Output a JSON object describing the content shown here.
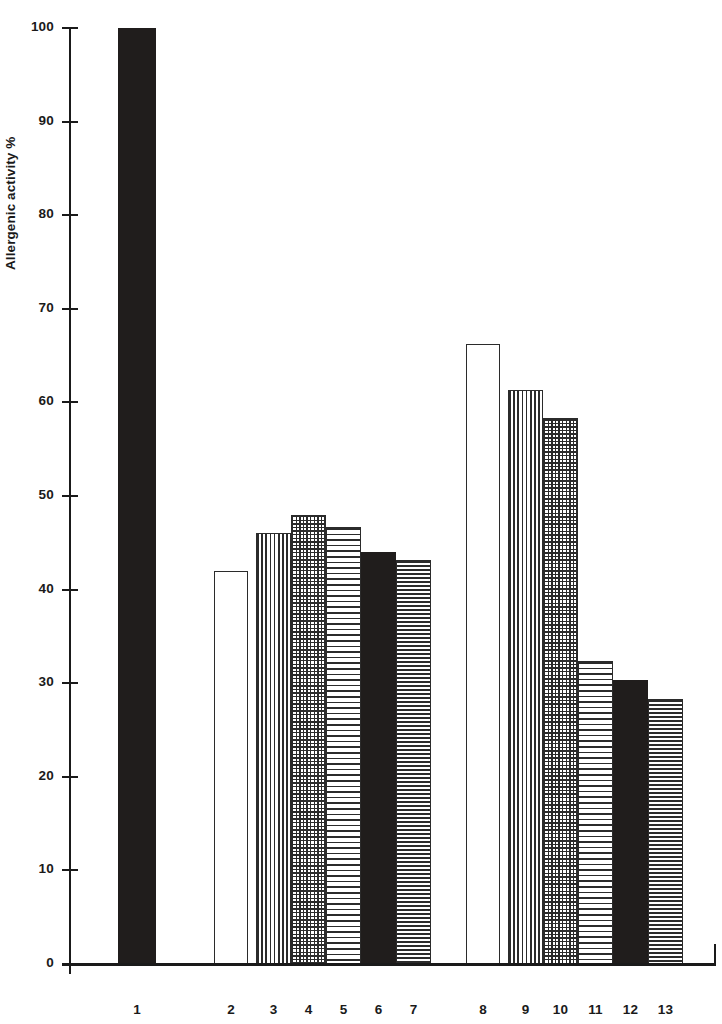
{
  "chart_data": {
    "type": "bar",
    "title": "",
    "subtitle": "",
    "xlabel": "",
    "ylabel": "Allergenic activity %",
    "ylim": [
      0,
      100
    ],
    "ytick_labels": [
      "0",
      "10",
      "20",
      "30",
      "40",
      "50",
      "60",
      "70",
      "80",
      "90",
      "100"
    ],
    "ytick_values": [
      0,
      10,
      20,
      30,
      40,
      50,
      60,
      70,
      80,
      90,
      100
    ],
    "grid": false,
    "legend": null,
    "categories": [
      "1",
      "2",
      "3",
      "4",
      "5",
      "6",
      "7",
      "8",
      "9",
      "10",
      "11",
      "12",
      "13"
    ],
    "values": [
      100,
      42,
      46,
      48,
      46.7,
      44,
      43.2,
      66.2,
      61.3,
      58.3,
      32.4,
      30.3,
      28.3
    ],
    "bars": [
      {
        "label": "1",
        "value": 100,
        "fill": "solid",
        "x": 118,
        "width": 38
      },
      {
        "label": "2",
        "value": 42,
        "fill": "empty",
        "x": 214,
        "width": 34
      },
      {
        "label": "3",
        "value": 46,
        "fill": "vertical",
        "x": 256,
        "width": 35
      },
      {
        "label": "4",
        "value": 48,
        "fill": "cross",
        "x": 291,
        "width": 35
      },
      {
        "label": "5",
        "value": 46.7,
        "fill": "horizontal",
        "x": 326,
        "width": 35
      },
      {
        "label": "6",
        "value": 44,
        "fill": "solid",
        "x": 361,
        "width": 35
      },
      {
        "label": "7",
        "value": 43.2,
        "fill": "horizontal-dense",
        "x": 396,
        "width": 35
      },
      {
        "label": "8",
        "value": 66.2,
        "fill": "empty",
        "x": 466,
        "width": 34
      },
      {
        "label": "9",
        "value": 61.3,
        "fill": "vertical",
        "x": 508,
        "width": 35
      },
      {
        "label": "10",
        "value": 58.3,
        "fill": "cross",
        "x": 543,
        "width": 35
      },
      {
        "label": "11",
        "value": 32.4,
        "fill": "horizontal",
        "x": 578,
        "width": 35
      },
      {
        "label": "12",
        "value": 30.3,
        "fill": "solid",
        "x": 613,
        "width": 35
      },
      {
        "label": "13",
        "value": 28.3,
        "fill": "horizontal-dense",
        "x": 648,
        "width": 35
      }
    ],
    "colors": {
      "ink": "#201d1c",
      "pattern": "#2b2b2b",
      "background": "#ffffff"
    }
  },
  "geometry": {
    "plot_top_y": 28,
    "plot_baseline_y": 964,
    "axis_x": 69
  }
}
